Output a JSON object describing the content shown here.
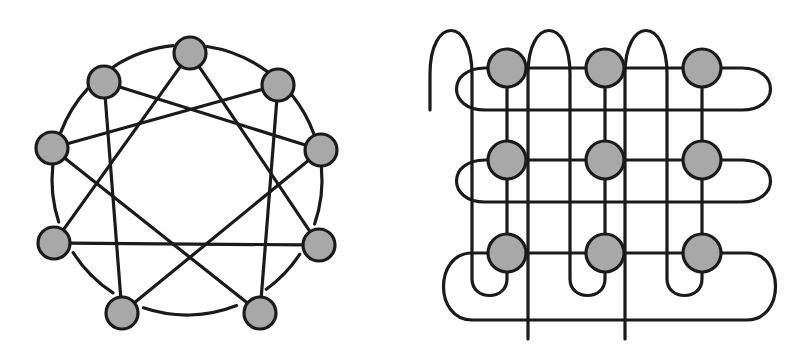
{
  "figure": {
    "background_color": "#ffffff",
    "node_fill_color": "#a8a8a8",
    "stroke_color": "#1a1a1a",
    "stroke_width": 3.2,
    "panels": [
      {
        "id": "left",
        "name": "circulant-graph",
        "caption": "",
        "node_count": 9,
        "node_radius": 16,
        "layout": "circle",
        "circle_center": [
          187,
          180
        ],
        "circle_radius": 135,
        "connection_rule": "C9(1,3): ring edges drawn as arcs plus distance-3 chords",
        "nodes": [
          {
            "id": 0,
            "x": 190,
            "y": 53
          },
          {
            "id": 1,
            "x": 278,
            "y": 85
          },
          {
            "id": 2,
            "x": 321,
            "y": 150
          },
          {
            "id": 3,
            "x": 319,
            "y": 245
          },
          {
            "id": 4,
            "x": 260,
            "y": 313
          },
          {
            "id": 5,
            "x": 122,
            "y": 313
          },
          {
            "id": 6,
            "x": 54,
            "y": 243
          },
          {
            "id": 7,
            "x": 52,
            "y": 148
          },
          {
            "id": 8,
            "x": 104,
            "y": 82
          }
        ],
        "ring_edges": [
          [
            0,
            1
          ],
          [
            1,
            2
          ],
          [
            2,
            3
          ],
          [
            3,
            4
          ],
          [
            4,
            5
          ],
          [
            5,
            6
          ],
          [
            6,
            7
          ],
          [
            7,
            8
          ],
          [
            8,
            0
          ]
        ],
        "chord_edges": [
          [
            0,
            3
          ],
          [
            1,
            4
          ],
          [
            2,
            5
          ],
          [
            3,
            6
          ],
          [
            4,
            7
          ],
          [
            5,
            8
          ],
          [
            6,
            0
          ],
          [
            7,
            1
          ],
          [
            8,
            2
          ]
        ]
      },
      {
        "id": "right",
        "name": "torus-mesh-3x3",
        "caption": "",
        "node_count": 9,
        "node_radius": 19,
        "layout": "grid",
        "rows": 3,
        "cols": 3,
        "connection_rule": "3x3 wraparound mesh (torus): row and column ends joined by looping links",
        "col_x": [
          105,
          203,
          300
        ],
        "row_y": [
          68,
          160,
          253
        ],
        "nodes": [
          {
            "id": "r0c0",
            "row": 0,
            "col": 0,
            "x": 105,
            "y": 68
          },
          {
            "id": "r0c1",
            "row": 0,
            "col": 1,
            "x": 203,
            "y": 68
          },
          {
            "id": "r0c2",
            "row": 0,
            "col": 2,
            "x": 300,
            "y": 68
          },
          {
            "id": "r1c0",
            "row": 1,
            "col": 0,
            "x": 105,
            "y": 160
          },
          {
            "id": "r1c1",
            "row": 1,
            "col": 1,
            "x": 203,
            "y": 160
          },
          {
            "id": "r1c2",
            "row": 1,
            "col": 2,
            "x": 300,
            "y": 160
          },
          {
            "id": "r2c0",
            "row": 2,
            "col": 0,
            "x": 105,
            "y": 253
          },
          {
            "id": "r2c1",
            "row": 2,
            "col": 1,
            "x": 203,
            "y": 253
          },
          {
            "id": "r2c2",
            "row": 2,
            "col": 2,
            "x": 300,
            "y": 253
          }
        ],
        "straight_edges": [
          [
            "r0c0",
            "r0c1"
          ],
          [
            "r0c1",
            "r0c2"
          ],
          [
            "r1c0",
            "r1c1"
          ],
          [
            "r1c1",
            "r1c2"
          ],
          [
            "r2c0",
            "r2c1"
          ],
          [
            "r2c1",
            "r2c2"
          ],
          [
            "r0c0",
            "r1c0"
          ],
          [
            "r1c0",
            "r2c0"
          ],
          [
            "r0c1",
            "r1c1"
          ],
          [
            "r1c1",
            "r2c1"
          ],
          [
            "r0c2",
            "r1c2"
          ],
          [
            "r1c2",
            "r2c2"
          ]
        ],
        "wrap_edges": [
          {
            "kind": "row-wrap",
            "from": "r0c2",
            "to": "r0c0",
            "side": "right-to-left"
          },
          {
            "kind": "row-wrap",
            "from": "r1c2",
            "to": "r1c0",
            "side": "right-to-left"
          },
          {
            "kind": "row-wrap",
            "from": "r2c2",
            "to": "r2c0",
            "side": "right-to-left"
          },
          {
            "kind": "col-wrap",
            "from": "r2c0",
            "to": "r0c0",
            "side": "bottom-to-top"
          },
          {
            "kind": "col-wrap",
            "from": "r2c1",
            "to": "r0c1",
            "side": "bottom-to-top"
          },
          {
            "kind": "col-wrap",
            "from": "r2c2",
            "to": "r0c2",
            "side": "bottom-to-top"
          }
        ]
      }
    ]
  }
}
